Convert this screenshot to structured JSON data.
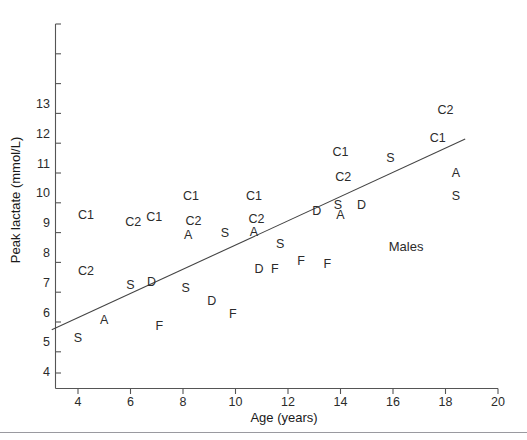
{
  "chart_data": {
    "type": "scatter",
    "title": "",
    "xlabel": "Age (years)",
    "ylabel": "Peak lactate (mmol/L)",
    "xlim": [
      3,
      20
    ],
    "ylim": [
      3.6,
      13.3
    ],
    "xticks": [
      4,
      6,
      8,
      10,
      12,
      14,
      16,
      18,
      20
    ],
    "yticks": [
      4,
      5,
      6,
      7,
      8,
      9,
      10,
      11,
      12,
      13
    ],
    "grid": false,
    "legend": "none",
    "annotations": [
      {
        "text": "Males",
        "x": 16.5,
        "y": 8.2
      }
    ],
    "marker_style": "text-letter",
    "series": [
      {
        "name": "subjects",
        "note": "Each point is rendered as a letter code (group label) centred on its data coordinate.",
        "points": [
          {
            "label": "S",
            "x": 4.0,
            "y": 5.15
          },
          {
            "label": "C1",
            "x": 4.3,
            "y": 9.28
          },
          {
            "label": "C2",
            "x": 4.3,
            "y": 7.4
          },
          {
            "label": "A",
            "x": 5.0,
            "y": 5.75
          },
          {
            "label": "C2",
            "x": 6.1,
            "y": 9.05
          },
          {
            "label": "S",
            "x": 6.0,
            "y": 6.93
          },
          {
            "label": "C1",
            "x": 6.9,
            "y": 9.22
          },
          {
            "label": "D",
            "x": 6.8,
            "y": 7.02
          },
          {
            "label": "F",
            "x": 7.1,
            "y": 5.55
          },
          {
            "label": "C1",
            "x": 8.3,
            "y": 9.9
          },
          {
            "label": "C2",
            "x": 8.4,
            "y": 9.08
          },
          {
            "label": "A",
            "x": 8.2,
            "y": 8.62
          },
          {
            "label": "S",
            "x": 8.1,
            "y": 6.82
          },
          {
            "label": "D",
            "x": 9.1,
            "y": 6.38
          },
          {
            "label": "S",
            "x": 9.6,
            "y": 8.68
          },
          {
            "label": "F",
            "x": 9.9,
            "y": 5.95
          },
          {
            "label": "C1",
            "x": 10.7,
            "y": 9.92
          },
          {
            "label": "C2",
            "x": 10.8,
            "y": 9.15
          },
          {
            "label": "A",
            "x": 10.7,
            "y": 8.72
          },
          {
            "label": "D",
            "x": 10.9,
            "y": 7.45
          },
          {
            "label": "F",
            "x": 11.5,
            "y": 7.45
          },
          {
            "label": "S",
            "x": 11.7,
            "y": 8.3
          },
          {
            "label": "F",
            "x": 12.5,
            "y": 7.72
          },
          {
            "label": "D",
            "x": 13.1,
            "y": 9.4
          },
          {
            "label": "F",
            "x": 13.5,
            "y": 7.62
          },
          {
            "label": "C1",
            "x": 14.0,
            "y": 11.4
          },
          {
            "label": "C2",
            "x": 14.1,
            "y": 10.55
          },
          {
            "label": "S",
            "x": 13.9,
            "y": 9.62
          },
          {
            "label": "A",
            "x": 14.0,
            "y": 9.28
          },
          {
            "label": "D",
            "x": 14.8,
            "y": 9.62
          },
          {
            "label": "S",
            "x": 15.9,
            "y": 11.2
          },
          {
            "label": "C2",
            "x": 18.0,
            "y": 12.8
          },
          {
            "label": "C1",
            "x": 17.7,
            "y": 11.85
          },
          {
            "label": "A",
            "x": 18.4,
            "y": 10.68
          },
          {
            "label": "S",
            "x": 18.4,
            "y": 9.92
          }
        ]
      }
    ],
    "fit_line": {
      "type": "linear-regression",
      "x_start": 3.0,
      "y_start": 5.45,
      "x_end": 18.75,
      "y_end": 11.85
    }
  }
}
